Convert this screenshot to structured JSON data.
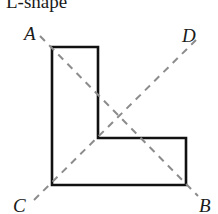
{
  "figure": {
    "title": "L-shape",
    "stroke_color": "#111111",
    "dash_color": "#8c8c8c",
    "background_color": "#ffffff",
    "outline_width": 2.6,
    "dash_width": 2,
    "dash_pattern": "7 6",
    "polygon": {
      "name": "l-shape-outline",
      "points": "52,47 98,47 98,138 186,138 186,185 52,185",
      "vertices": [
        {
          "x": 52,
          "y": 47
        },
        {
          "x": 98,
          "y": 47
        },
        {
          "x": 98,
          "y": 138
        },
        {
          "x": 186,
          "y": 138
        },
        {
          "x": 186,
          "y": 185
        },
        {
          "x": 52,
          "y": 185
        }
      ]
    },
    "diagonals": [
      {
        "name": "diagonal-A-B",
        "from_label": "A",
        "to_label": "B",
        "x1": 40,
        "y1": 36,
        "x2": 198,
        "y2": 196
      },
      {
        "name": "diagonal-C-D",
        "from_label": "C",
        "to_label": "D",
        "x1": 34,
        "y1": 200,
        "x2": 196,
        "y2": 40
      }
    ],
    "labels": {
      "a": "A",
      "b": "B",
      "c": "C",
      "d": "D"
    }
  }
}
